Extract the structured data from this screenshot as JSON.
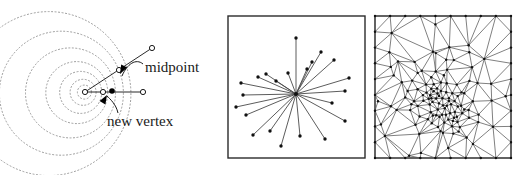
{
  "figure": {
    "name": "three-panel-mesh-refinement-figure",
    "background_color": "#ffffff",
    "width": 527,
    "height": 175,
    "panel_count": 3
  },
  "colors": {
    "ink": "#1a1a1a",
    "line": "#3a3a3a",
    "frame": "#2b2b2b",
    "dotted_circle": "#9a9a9a",
    "vertex_fill": "#ffffff",
    "new_vertex_fill": "#000000",
    "mesh_line": "#555555"
  },
  "left_panel": {
    "name": "spiral-circles-panel",
    "labels": {
      "midpoint": "midpoint",
      "new_vertex": "new vertex"
    },
    "center": {
      "x": 85,
      "y": 92
    },
    "dotted_spiral_radii": [
      7,
      13,
      21,
      31,
      45,
      62,
      82
    ],
    "open_vertices": [
      {
        "name": "center-vertex",
        "x": 85,
        "y": 92
      },
      {
        "name": "outer-vertex",
        "x": 152,
        "y": 48
      },
      {
        "name": "midpoint-vertex",
        "x": 119,
        "y": 70
      },
      {
        "name": "right-vertex",
        "x": 143,
        "y": 92
      },
      {
        "name": "inner-vertex",
        "x": 103,
        "y": 92
      }
    ],
    "filled_vertices": [
      {
        "name": "new-vertex-point",
        "x": 112,
        "y": 91
      }
    ],
    "segments": [
      {
        "name": "long-spoke",
        "x1": 85,
        "y1": 92,
        "x2": 152,
        "y2": 48
      },
      {
        "name": "horizontal-spoke",
        "x1": 85,
        "y1": 92,
        "x2": 143,
        "y2": 92
      }
    ]
  },
  "middle_panel": {
    "name": "star-graph-panel",
    "frame": {
      "x": 228,
      "y": 16,
      "width": 137,
      "height": 142
    },
    "hub": {
      "x": 296,
      "y": 94
    },
    "spoke_endpoints": [
      {
        "x": 296,
        "y": 38
      },
      {
        "x": 321,
        "y": 52
      },
      {
        "x": 334,
        "y": 60
      },
      {
        "x": 349,
        "y": 78
      },
      {
        "x": 345,
        "y": 91
      },
      {
        "x": 332,
        "y": 103
      },
      {
        "x": 345,
        "y": 121
      },
      {
        "x": 325,
        "y": 139
      },
      {
        "x": 300,
        "y": 136
      },
      {
        "x": 281,
        "y": 146
      },
      {
        "x": 270,
        "y": 131
      },
      {
        "x": 253,
        "y": 135
      },
      {
        "x": 246,
        "y": 115
      },
      {
        "x": 236,
        "y": 107
      },
      {
        "x": 243,
        "y": 95
      },
      {
        "x": 241,
        "y": 83
      },
      {
        "x": 258,
        "y": 77
      },
      {
        "x": 266,
        "y": 74
      },
      {
        "x": 276,
        "y": 81
      },
      {
        "x": 307,
        "y": 69
      },
      {
        "x": 312,
        "y": 62
      },
      {
        "x": 288,
        "y": 73
      }
    ],
    "spoke_count": 22
  },
  "right_panel": {
    "name": "delaunay-triangulation-panel",
    "frame": {
      "x": 375,
      "y": 16,
      "width": 136,
      "height": 142
    },
    "description": "dense graded triangular mesh refined toward an interior point",
    "triangle_density": "high"
  }
}
